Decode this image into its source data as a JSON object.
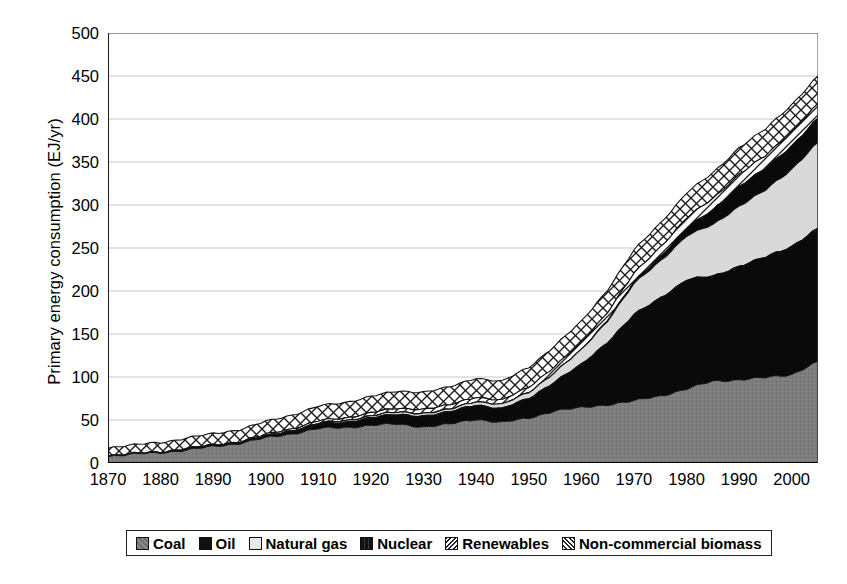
{
  "chart_data": {
    "type": "area",
    "stacked": true,
    "title": "",
    "xlabel": "",
    "ylabel": "Primary energy consumption (EJ/yr)",
    "xlim": [
      1870,
      2005
    ],
    "ylim": [
      0,
      500
    ],
    "ytick_step": 50,
    "xtick_step": 10,
    "grid": true,
    "grid_axis": "y",
    "legend_position": "bottom",
    "yticks": [
      "0",
      "50",
      "100",
      "150",
      "200",
      "250",
      "300",
      "350",
      "400",
      "450",
      "500"
    ],
    "xticks": [
      "1870",
      "1880",
      "1890",
      "1900",
      "1910",
      "1920",
      "1930",
      "1940",
      "1950",
      "1960",
      "1970",
      "1980",
      "1990",
      "2000"
    ],
    "x": [
      1870,
      1875,
      1880,
      1885,
      1890,
      1895,
      1900,
      1905,
      1910,
      1915,
      1920,
      1925,
      1930,
      1935,
      1940,
      1945,
      1950,
      1955,
      1960,
      1965,
      1970,
      1975,
      1980,
      1985,
      1990,
      1995,
      2000,
      2005
    ],
    "series": [
      {
        "name": "Coal",
        "color": "#7d7d7d",
        "pattern": "solid-gray",
        "values": [
          8,
          10,
          12,
          15,
          19,
          23,
          29,
          34,
          40,
          41,
          44,
          45,
          42,
          45,
          51,
          47,
          52,
          61,
          64,
          68,
          72,
          78,
          86,
          95,
          97,
          99,
          103,
          118
        ]
      },
      {
        "name": "Oil",
        "color": "#0a0a0a",
        "pattern": "solid-black",
        "values": [
          0,
          0,
          0,
          1,
          1,
          1,
          2,
          3,
          5,
          6,
          9,
          11,
          13,
          14,
          17,
          16,
          23,
          34,
          50,
          73,
          100,
          114,
          127,
          122,
          132,
          140,
          149,
          155
        ]
      },
      {
        "name": "Natural gas",
        "color": "#d9d9d9",
        "pattern": "solid-light",
        "values": [
          0,
          0,
          0,
          0,
          0,
          0,
          0,
          1,
          1,
          2,
          2,
          3,
          3,
          3,
          4,
          5,
          7,
          11,
          17,
          25,
          36,
          43,
          51,
          60,
          70,
          78,
          90,
          100
        ]
      },
      {
        "name": "Nuclear",
        "color": "#0a0a0a",
        "pattern": "solid-black",
        "values": [
          0,
          0,
          0,
          0,
          0,
          0,
          0,
          0,
          0,
          0,
          0,
          0,
          0,
          0,
          0,
          0,
          0,
          0,
          0,
          1,
          2,
          5,
          9,
          17,
          23,
          25,
          27,
          28
        ]
      },
      {
        "name": "Renewables",
        "color": "#ffffff",
        "pattern": "diagonal-hatch",
        "values": [
          1,
          1,
          1,
          1,
          1,
          1,
          2,
          2,
          3,
          3,
          4,
          4,
          5,
          5,
          5,
          5,
          6,
          7,
          8,
          9,
          10,
          11,
          12,
          13,
          14,
          15,
          16,
          17
        ]
      },
      {
        "name": "Non-commercial biomass",
        "color": "#ffffff",
        "pattern": "crosshatch",
        "values": [
          9,
          10,
          11,
          12,
          13,
          14,
          15,
          16,
          17,
          18,
          19,
          20,
          20,
          21,
          22,
          22,
          23,
          24,
          25,
          26,
          27,
          28,
          29,
          30,
          31,
          31,
          32,
          32
        ]
      }
    ]
  },
  "axes": {
    "y_title": "Primary energy consumption (EJ/yr)"
  },
  "legend": {
    "entries": [
      {
        "label": "Coal"
      },
      {
        "label": "Oil"
      },
      {
        "label": "Natural gas"
      },
      {
        "label": "Nuclear"
      },
      {
        "label": "Renewables"
      },
      {
        "label": "Non-commercial biomass"
      }
    ]
  }
}
